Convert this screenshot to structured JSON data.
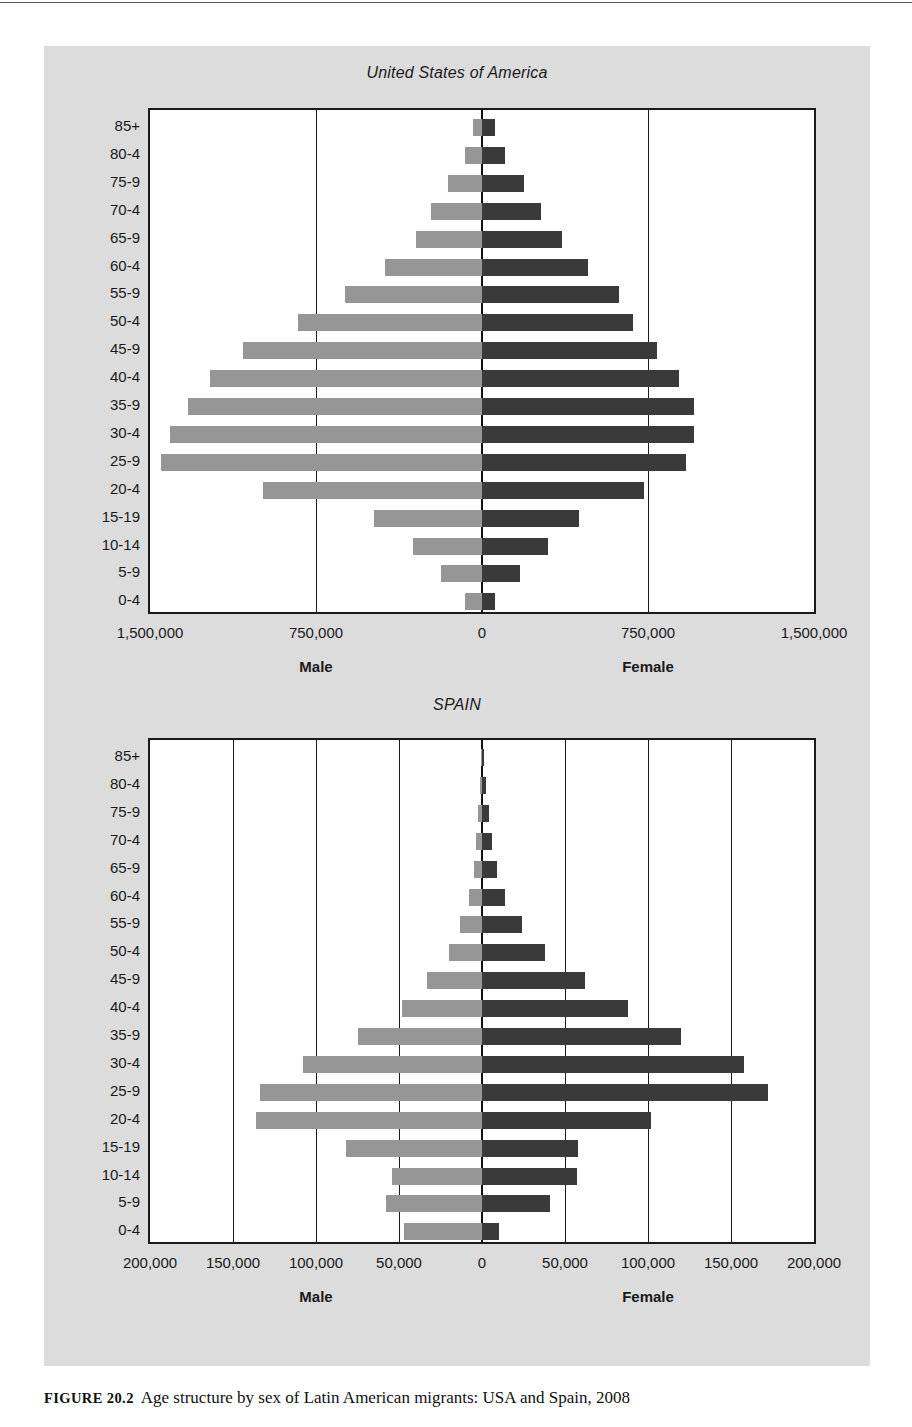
{
  "caption": {
    "figure_number": "FIGURE 20.2",
    "text": "Age structure by sex of Latin American migrants: USA and Spain, 2008"
  },
  "charts": [
    {
      "title": "United States of America",
      "male_label": "Male",
      "female_label": "Female"
    },
    {
      "title": "SPAIN",
      "male_label": "Male",
      "female_label": "Female"
    }
  ],
  "colors": {
    "male_bar": "#969696",
    "female_bar": "#3a3a3a",
    "panel_background": "#dcdcdc",
    "plot_background": "#ffffff",
    "axis": "#1a1a1a"
  },
  "chart_data": [
    {
      "type": "bar",
      "subtype": "population-pyramid",
      "title": "United States of America",
      "xlabel": "",
      "ylabel": "",
      "grid": true,
      "legend_position": "below-axis",
      "categories": [
        "85+",
        "80-4",
        "75-9",
        "70-4",
        "65-9",
        "60-4",
        "55-9",
        "50-4",
        "45-9",
        "40-4",
        "35-9",
        "30-4",
        "25-9",
        "20-4",
        "15-19",
        "10-14",
        "5-9",
        "0-4"
      ],
      "xlim": [
        -1500000,
        1500000
      ],
      "xticks": [
        -1500000,
        -750000,
        0,
        750000,
        1500000
      ],
      "xtick_labels": [
        "1,500,000",
        "750,000",
        "0",
        "750,000",
        "1,500,000"
      ],
      "series": [
        {
          "name": "Male",
          "direction": "left",
          "values": [
            40000,
            75000,
            155000,
            230000,
            300000,
            440000,
            620000,
            830000,
            1080000,
            1230000,
            1330000,
            1410000,
            1450000,
            990000,
            490000,
            310000,
            185000,
            75000
          ]
        },
        {
          "name": "Female",
          "direction": "right",
          "values": [
            60000,
            105000,
            190000,
            265000,
            360000,
            480000,
            620000,
            680000,
            790000,
            890000,
            960000,
            960000,
            920000,
            730000,
            440000,
            300000,
            170000,
            60000
          ]
        }
      ]
    },
    {
      "type": "bar",
      "subtype": "population-pyramid",
      "title": "SPAIN",
      "xlabel": "",
      "ylabel": "",
      "grid": true,
      "legend_position": "below-axis",
      "categories": [
        "85+",
        "80-4",
        "75-9",
        "70-4",
        "65-9",
        "60-4",
        "55-9",
        "50-4",
        "45-9",
        "40-4",
        "35-9",
        "30-4",
        "25-9",
        "20-4",
        "15-19",
        "10-14",
        "5-9",
        "0-4"
      ],
      "xlim": [
        -200000,
        200000
      ],
      "xticks": [
        -200000,
        -150000,
        -100000,
        -50000,
        0,
        50000,
        100000,
        150000,
        200000
      ],
      "xtick_labels": [
        "200,000",
        "150,000",
        "100,000",
        "50,000",
        "0",
        "50,000",
        "100,000",
        "150,000",
        "200,000"
      ],
      "series": [
        {
          "name": "Male",
          "direction": "left",
          "values": [
            500,
            1500,
            2500,
            3500,
            5000,
            8000,
            13000,
            20000,
            33000,
            48000,
            75000,
            108000,
            134000,
            136000,
            82000,
            54000,
            58000,
            47000,
            10000
          ]
        },
        {
          "name": "Female",
          "direction": "right",
          "values": [
            1000,
            2500,
            4000,
            6000,
            9000,
            14000,
            24000,
            38000,
            62000,
            88000,
            120000,
            158000,
            172000,
            102000,
            58000,
            57000,
            41000,
            10000
          ]
        }
      ]
    }
  ]
}
